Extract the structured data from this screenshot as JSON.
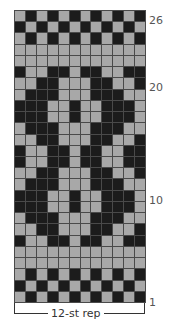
{
  "chart_data": {
    "type": "table",
    "title": "",
    "columns": 12,
    "rows": 26,
    "colors": {
      "dark": "#1c1c1c",
      "light": "#a8a8a8",
      "gridline": "#4a4a4a"
    },
    "row_labels": [
      {
        "row": 26,
        "text": "26"
      },
      {
        "row": 20,
        "text": "20"
      },
      {
        "row": 10,
        "text": "10"
      },
      {
        "row": 1,
        "text": "1"
      }
    ],
    "repeat_label": "12-st rep",
    "grid": [
      [
        0,
        1,
        0,
        1,
        0,
        1,
        0,
        1,
        0,
        1,
        0,
        1
      ],
      [
        1,
        0,
        1,
        0,
        1,
        0,
        1,
        0,
        1,
        0,
        1,
        0
      ],
      [
        0,
        1,
        0,
        1,
        0,
        1,
        0,
        1,
        0,
        1,
        0,
        1
      ],
      [
        0,
        0,
        0,
        0,
        0,
        0,
        0,
        0,
        0,
        0,
        0,
        0
      ],
      [
        0,
        0,
        0,
        0,
        0,
        0,
        0,
        0,
        0,
        0,
        0,
        0
      ],
      [
        1,
        0,
        0,
        1,
        1,
        0,
        1,
        1,
        0,
        0,
        1,
        1
      ],
      [
        0,
        0,
        1,
        1,
        0,
        0,
        0,
        1,
        1,
        0,
        0,
        1
      ],
      [
        0,
        1,
        1,
        1,
        0,
        0,
        0,
        1,
        1,
        1,
        0,
        0
      ],
      [
        1,
        1,
        1,
        0,
        0,
        1,
        0,
        0,
        1,
        1,
        1,
        0
      ],
      [
        1,
        1,
        1,
        0,
        0,
        1,
        0,
        0,
        1,
        1,
        1,
        0
      ],
      [
        0,
        1,
        1,
        1,
        0,
        0,
        0,
        1,
        1,
        1,
        0,
        0
      ],
      [
        0,
        0,
        1,
        1,
        0,
        0,
        0,
        1,
        1,
        0,
        0,
        1
      ],
      [
        1,
        0,
        0,
        1,
        1,
        0,
        1,
        1,
        0,
        0,
        1,
        1
      ],
      [
        1,
        0,
        0,
        1,
        1,
        0,
        1,
        1,
        0,
        0,
        1,
        1
      ],
      [
        0,
        0,
        1,
        1,
        0,
        0,
        0,
        1,
        1,
        0,
        0,
        1
      ],
      [
        0,
        1,
        1,
        1,
        0,
        0,
        0,
        1,
        1,
        1,
        0,
        0
      ],
      [
        1,
        1,
        1,
        0,
        0,
        1,
        0,
        0,
        1,
        1,
        1,
        0
      ],
      [
        1,
        1,
        1,
        0,
        0,
        1,
        0,
        0,
        1,
        1,
        1,
        0
      ],
      [
        0,
        1,
        1,
        1,
        0,
        0,
        0,
        1,
        1,
        1,
        0,
        0
      ],
      [
        0,
        0,
        1,
        1,
        0,
        0,
        0,
        1,
        1,
        0,
        0,
        1
      ],
      [
        1,
        0,
        0,
        1,
        1,
        0,
        1,
        1,
        0,
        0,
        1,
        1
      ],
      [
        0,
        0,
        0,
        0,
        0,
        0,
        0,
        0,
        0,
        0,
        0,
        0
      ],
      [
        0,
        0,
        0,
        0,
        0,
        0,
        0,
        0,
        0,
        0,
        0,
        0
      ],
      [
        0,
        1,
        0,
        1,
        0,
        1,
        0,
        1,
        0,
        1,
        0,
        1
      ],
      [
        1,
        0,
        1,
        0,
        1,
        0,
        1,
        0,
        1,
        0,
        1,
        0
      ],
      [
        0,
        1,
        0,
        1,
        0,
        1,
        0,
        1,
        0,
        1,
        0,
        1
      ]
    ]
  },
  "labels": {
    "row26": "26",
    "row20": "20",
    "row10": "10",
    "row1": "1",
    "repeat": "12-st rep"
  }
}
